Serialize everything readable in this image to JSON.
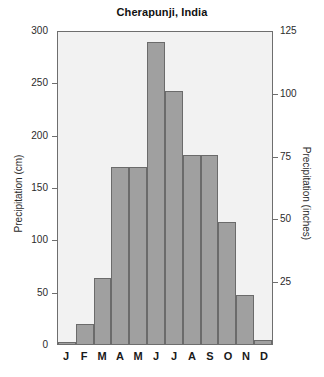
{
  "chart_data": {
    "type": "bar",
    "title": "Cherapunji, India",
    "xlabel": "",
    "ylabel": "Precipitation (cm)",
    "y2label": "Precipitation (inches)",
    "categories": [
      "J",
      "F",
      "M",
      "A",
      "M",
      "J",
      "J",
      "A",
      "S",
      "O",
      "N",
      "D"
    ],
    "month_names": [
      "January",
      "February",
      "March",
      "April",
      "May",
      "June",
      "July",
      "August",
      "September",
      "October",
      "November",
      "December"
    ],
    "values": [
      2,
      19,
      63,
      170,
      170,
      290,
      243,
      182,
      182,
      117,
      47,
      4
    ],
    "units": "cm",
    "ylim": [
      0,
      300
    ],
    "yticks": [
      0,
      50,
      100,
      150,
      200,
      250,
      300
    ],
    "y2lim": [
      0,
      125
    ],
    "y2ticks": [
      25,
      50,
      75,
      100,
      125
    ],
    "y2_units": "inches",
    "grid": false,
    "legend": "none",
    "bar_color": "#a0a0a0",
    "bar_edge_color": "#6b6b6b",
    "plot_background": "#f2f2f2",
    "axis_color": "#6e6e6e"
  }
}
